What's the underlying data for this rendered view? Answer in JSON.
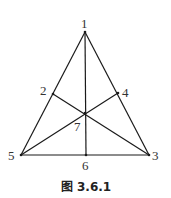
{
  "figure": {
    "caption": "图 3.6.1",
    "points": [
      {
        "id": "1",
        "label": "1",
        "x": 85,
        "y": 32,
        "lx": 81,
        "ly": 28
      },
      {
        "id": "2",
        "label": "2",
        "x": 53,
        "y": 94,
        "lx": 40,
        "ly": 95
      },
      {
        "id": "3",
        "label": "3",
        "x": 149,
        "y": 155,
        "lx": 152,
        "ly": 160
      },
      {
        "id": "4",
        "label": "4",
        "x": 118,
        "y": 93,
        "lx": 122,
        "ly": 97
      },
      {
        "id": "5",
        "label": "5",
        "x": 21,
        "y": 155,
        "lx": 8,
        "ly": 160
      },
      {
        "id": "6",
        "label": "6",
        "x": 86,
        "y": 155,
        "lx": 82,
        "ly": 170
      },
      {
        "id": "7",
        "label": "7",
        "x": 85,
        "y": 113,
        "lx": 74,
        "ly": 131
      }
    ],
    "edges": [
      [
        "1",
        "5"
      ],
      [
        "1",
        "3"
      ],
      [
        "5",
        "3"
      ],
      [
        "1",
        "6"
      ],
      [
        "5",
        "4"
      ],
      [
        "3",
        "2"
      ]
    ],
    "stroke_color": "#1a1a1a"
  }
}
